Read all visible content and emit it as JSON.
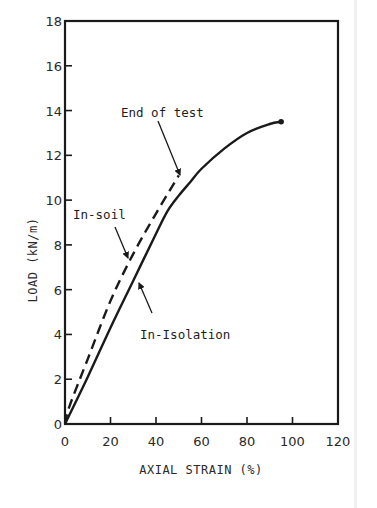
{
  "chart_data": {
    "type": "line",
    "title": "",
    "xlabel": "AXIAL STRAIN (%)",
    "ylabel": "LOAD (kN/m)",
    "xlim": [
      0,
      120
    ],
    "ylim": [
      0,
      18
    ],
    "xticks": [
      0,
      20,
      40,
      60,
      80,
      100,
      120
    ],
    "yticks": [
      0,
      2,
      4,
      6,
      8,
      10,
      12,
      14,
      16,
      18
    ],
    "xtick_labels": [
      "0",
      "20",
      "40",
      "60",
      "80",
      "100",
      "120"
    ],
    "ytick_labels": [
      "0",
      "2",
      "4",
      "6",
      "8",
      "10",
      "12",
      "14",
      "16",
      "18"
    ],
    "grid": false,
    "legend": "none (inline annotations)",
    "series": [
      {
        "name": "In-Isolation",
        "style": "solid",
        "x": [
          0,
          10,
          20,
          30,
          40,
          45,
          50,
          55,
          60,
          70,
          80,
          90,
          95
        ],
        "y": [
          0,
          2.1,
          4.3,
          6.4,
          8.5,
          9.5,
          10.2,
          10.8,
          11.4,
          12.3,
          13.0,
          13.4,
          13.5
        ],
        "end_marker": true
      },
      {
        "name": "In-soil",
        "style": "dashed",
        "x": [
          0,
          2,
          10,
          20,
          30,
          40,
          50
        ],
        "y": [
          0,
          0.8,
          2.9,
          5.5,
          7.6,
          9.4,
          11.1
        ],
        "end_marker": false
      }
    ],
    "annotations": [
      {
        "text": "End of test",
        "text_pos": [
          121,
          117
        ],
        "arrow_from": [
          158,
          121
        ],
        "arrow_to": [
          180,
          175
        ]
      },
      {
        "text": "In-soil",
        "text_pos": [
          73,
          219
        ],
        "arrow_from": [
          115,
          227
        ],
        "arrow_to": [
          128,
          258
        ]
      },
      {
        "text": "In-Isolation",
        "text_pos": [
          140,
          339
        ],
        "arrow_from": [
          152,
          313
        ],
        "arrow_to": [
          139,
          283
        ]
      }
    ]
  },
  "layout": {
    "plot_left": 65,
    "plot_right": 338,
    "plot_top": 21,
    "plot_bottom": 424,
    "line_color": "#1a1a1a"
  }
}
